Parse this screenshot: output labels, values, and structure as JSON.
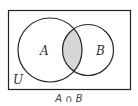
{
  "diagram": {
    "type": "venn",
    "universe_label": "U",
    "sets": [
      {
        "label": "A"
      },
      {
        "label": "B"
      }
    ],
    "shaded_region": "A ∩ B",
    "caption": "A ∩ B",
    "colors": {
      "stroke": "#222222",
      "shade": "#d6d6d6",
      "background": "#ffffff"
    }
  }
}
